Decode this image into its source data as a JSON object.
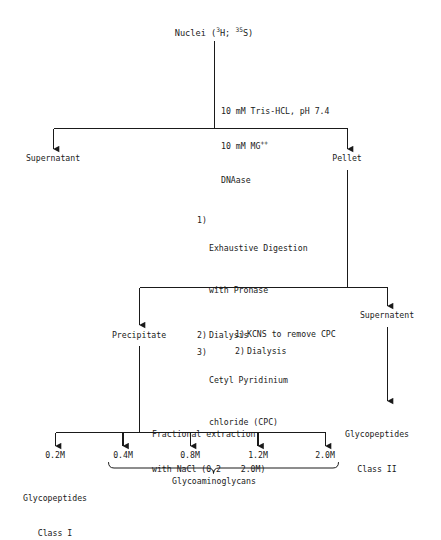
{
  "diagram": {
    "ink_color": "#1a1a1a",
    "background": "#ffffff",
    "nodes": {
      "root": {
        "prefix": "Nuclei (",
        "iso1_sup": "3",
        "iso1": "H; ",
        "iso2_sup": "35",
        "iso2": "S)"
      },
      "supernatant_1": "Supernatant",
      "pellet": "Pellet",
      "precipitate": "Precipitate",
      "supernatent_2": "Supernatent",
      "glycopeptides_class_ii": {
        "line1": "Glycopeptides",
        "line2": "Class II"
      },
      "glycopeptides_class_i": {
        "line1": "Glycopeptides",
        "line2": "Class I"
      },
      "glycoaminoglycans": "Glycoaminoglycans"
    },
    "treatments": {
      "lysis": {
        "line1": "10 mM Tris-HCL, pH 7.4",
        "line2_pre": "10 mM MG",
        "line2_sup": "++",
        "line3": "DNAase"
      },
      "digestion_steps": [
        {
          "num": "1)",
          "text": "Exhaustive Digestion",
          "text2": "with Pronase"
        },
        {
          "num": "2)",
          "text": "Dialysis",
          "text2": ""
        },
        {
          "num": "3)",
          "text": "Cetyl Pyridinium",
          "text2": "chloride (CPC)"
        }
      ],
      "cpc_removal_steps": [
        {
          "num": "1)",
          "text": "KCNS to remove CPC"
        },
        {
          "num": "2)",
          "text": "Dialysis"
        }
      ],
      "fractional_extraction": {
        "line1": "Fractional extraction",
        "line2": "with NaCl (0.2    2.0M)"
      }
    },
    "fractions": [
      {
        "label": "0.2M"
      },
      {
        "label": "0.4M"
      },
      {
        "label": "0.8M"
      },
      {
        "label": "1.2M"
      },
      {
        "label": "2.0M"
      }
    ]
  }
}
